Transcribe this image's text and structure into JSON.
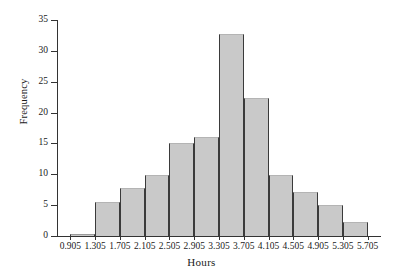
{
  "chart_data": {
    "type": "bar",
    "title": "",
    "xlabel": "Hours",
    "ylabel": "Frequency",
    "bin_width": 0.4,
    "bin_edges": [
      0.905,
      1.305,
      1.705,
      2.105,
      2.505,
      2.905,
      3.305,
      3.705,
      4.105,
      4.505,
      4.905,
      5.305,
      5.705
    ],
    "categories": [
      "0.905-1.305",
      "1.305-1.705",
      "1.705-2.105",
      "2.105-2.505",
      "2.505-2.905",
      "2.905-3.305",
      "3.305-3.705",
      "3.705-4.105",
      "4.105-4.505",
      "4.505-4.905",
      "4.905-5.305",
      "5.305-5.705"
    ],
    "values": [
      0.4,
      5.5,
      7.8,
      9.9,
      15,
      16,
      32.8,
      22.3,
      9.9,
      7.1,
      5.1,
      2.3
    ],
    "x_tick_labels": [
      "0.905",
      "1.305",
      "1.705",
      "2.105",
      "2.505",
      "2.905",
      "3.305",
      "3.705",
      "4.105",
      "4.505",
      "4.905",
      "5.305",
      "5.705"
    ],
    "y_tick_labels": [
      "0",
      "5",
      "10",
      "15",
      "20",
      "25",
      "30",
      "35"
    ],
    "y_ticks": [
      0,
      5,
      10,
      15,
      20,
      25,
      30,
      35
    ],
    "ylim": [
      0,
      35
    ],
    "xlim": [
      0.705,
      5.905
    ],
    "grid": false,
    "legend": null,
    "bar_color": "#c9c9c9",
    "bar_edge_color": "#3a3a3a",
    "axis_color": "#333333"
  }
}
